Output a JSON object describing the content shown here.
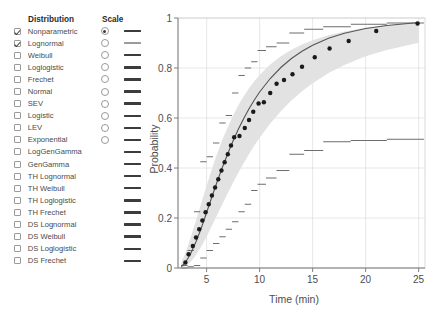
{
  "panel": {
    "header_distribution": "Distribution",
    "header_scale": "Scale",
    "rows": [
      {
        "label": "Nonparametric",
        "checked": true,
        "has_radio": true,
        "radio_selected": true,
        "line_color": "#3c3c3c"
      },
      {
        "label": "Lognormal",
        "checked": true,
        "has_radio": true,
        "radio_selected": false,
        "line_color": "#9b9b9b"
      },
      {
        "label": "Weibull",
        "checked": false,
        "has_radio": true,
        "radio_selected": false,
        "line_color": "#3c3c3c"
      },
      {
        "label": "Loglogistic",
        "checked": false,
        "has_radio": true,
        "radio_selected": false,
        "line_color": "#3c3c3c"
      },
      {
        "label": "Frechet",
        "checked": false,
        "has_radio": true,
        "radio_selected": false,
        "line_color": "#3c3c3c"
      },
      {
        "label": "Normal",
        "checked": false,
        "has_radio": true,
        "radio_selected": false,
        "line_color": "#3c3c3c"
      },
      {
        "label": "SEV",
        "checked": false,
        "has_radio": true,
        "radio_selected": false,
        "line_color": "#3c3c3c"
      },
      {
        "label": "Logistic",
        "checked": false,
        "has_radio": true,
        "radio_selected": false,
        "line_color": "#3c3c3c"
      },
      {
        "label": "LEV",
        "checked": false,
        "has_radio": true,
        "radio_selected": false,
        "line_color": "#3c3c3c"
      },
      {
        "label": "Exponential",
        "checked": false,
        "has_radio": true,
        "radio_selected": false,
        "line_color": "#3c3c3c"
      },
      {
        "label": "LogGenGamma",
        "checked": false,
        "has_radio": false,
        "radio_selected": false,
        "line_color": "#3c3c3c"
      },
      {
        "label": "GenGamma",
        "checked": false,
        "has_radio": false,
        "radio_selected": false,
        "line_color": "#3c3c3c"
      },
      {
        "label": "TH Lognormal",
        "checked": false,
        "has_radio": false,
        "radio_selected": false,
        "line_color": "#3c3c3c"
      },
      {
        "label": "TH Weibull",
        "checked": false,
        "has_radio": false,
        "radio_selected": false,
        "line_color": "#3c3c3c"
      },
      {
        "label": "TH Loglogistic",
        "checked": false,
        "has_radio": false,
        "radio_selected": false,
        "line_color": "#3c3c3c"
      },
      {
        "label": "TH Frechet",
        "checked": false,
        "has_radio": false,
        "radio_selected": false,
        "line_color": "#3c3c3c"
      },
      {
        "label": "DS Lognormal",
        "checked": false,
        "has_radio": false,
        "radio_selected": false,
        "line_color": "#3c3c3c"
      },
      {
        "label": "DS Weibull",
        "checked": false,
        "has_radio": false,
        "radio_selected": false,
        "line_color": "#3c3c3c"
      },
      {
        "label": "DS Loglogistic",
        "checked": false,
        "has_radio": false,
        "radio_selected": false,
        "line_color": "#3c3c3c"
      },
      {
        "label": "DS Frechet",
        "checked": false,
        "has_radio": false,
        "radio_selected": false,
        "line_color": "#3c3c3c"
      }
    ]
  },
  "chart_data": {
    "type": "line",
    "title": "",
    "xlabel": "Time (min)",
    "ylabel": "Probability",
    "xlim": [
      2.3,
      25.6
    ],
    "ylim": [
      0,
      1
    ],
    "xticks": [
      5,
      10,
      15,
      20,
      25
    ],
    "yticks": [
      0,
      0.2,
      0.4,
      0.6,
      0.8,
      1
    ],
    "ytick_labels": [
      "0",
      "0.2",
      "0.4",
      "0.6",
      "0.8",
      "1"
    ],
    "xtick_labels": [
      "5",
      "10",
      "15",
      "20",
      "25"
    ],
    "grid": true,
    "legend": "none",
    "band_color": "#e2e2e2",
    "fit_color": "#555555",
    "point_color": "#1a1a1a",
    "step_color": "#6d6d6d",
    "series": [
      {
        "name": "Lognormal fit",
        "type": "line",
        "x": [
          2.6,
          3.0,
          3.5,
          4.0,
          4.5,
          5.0,
          5.5,
          6.0,
          6.5,
          7.0,
          7.5,
          8.0,
          8.5,
          9.0,
          9.5,
          10.0,
          11.0,
          12.0,
          13.0,
          14.0,
          15.0,
          16.5,
          18.0,
          20.0,
          22.0,
          25.0
        ],
        "y": [
          0.005,
          0.022,
          0.058,
          0.105,
          0.16,
          0.222,
          0.285,
          0.346,
          0.404,
          0.458,
          0.509,
          0.556,
          0.598,
          0.637,
          0.672,
          0.704,
          0.758,
          0.802,
          0.838,
          0.867,
          0.891,
          0.919,
          0.939,
          0.958,
          0.97,
          0.982
        ]
      },
      {
        "name": "Lognormal 95% CI lower",
        "type": "line",
        "x": [
          2.6,
          3.0,
          3.5,
          4.0,
          4.5,
          5.0,
          5.5,
          6.0,
          6.5,
          7.0,
          7.5,
          8.0,
          8.5,
          9.0,
          9.5,
          10.0,
          11.0,
          12.0,
          13.0,
          14.0,
          15.0,
          16.5,
          18.0,
          20.0,
          22.0,
          25.0
        ],
        "y": [
          0.001,
          0.007,
          0.025,
          0.052,
          0.086,
          0.126,
          0.169,
          0.213,
          0.257,
          0.3,
          0.342,
          0.382,
          0.42,
          0.456,
          0.49,
          0.521,
          0.578,
          0.627,
          0.67,
          0.707,
          0.739,
          0.78,
          0.812,
          0.847,
          0.872,
          0.901
        ]
      },
      {
        "name": "Lognormal 95% CI upper",
        "type": "line",
        "x": [
          2.6,
          3.0,
          3.5,
          4.0,
          4.5,
          5.0,
          5.5,
          6.0,
          6.5,
          7.0,
          7.5,
          8.0,
          8.5,
          9.0,
          9.5,
          10.0,
          11.0,
          12.0,
          13.0,
          14.0,
          15.0,
          16.5,
          18.0,
          20.0,
          22.0,
          25.0
        ],
        "y": [
          0.02,
          0.06,
          0.122,
          0.19,
          0.26,
          0.33,
          0.396,
          0.458,
          0.514,
          0.564,
          0.61,
          0.651,
          0.687,
          0.719,
          0.747,
          0.772,
          0.814,
          0.847,
          0.873,
          0.894,
          0.911,
          0.931,
          0.946,
          0.961,
          0.971,
          0.982
        ]
      },
      {
        "name": "Nonparametric estimate",
        "type": "scatter",
        "x": [
          3.0,
          3.3,
          3.7,
          4.0,
          4.3,
          4.6,
          4.9,
          5.2,
          5.5,
          5.8,
          6.1,
          6.4,
          6.7,
          7.0,
          7.3,
          7.6,
          8.1,
          8.6,
          9.0,
          9.4,
          9.9,
          10.4,
          11.0,
          11.6,
          12.3,
          13.1,
          14.0,
          15.2,
          16.6,
          18.4,
          21.0,
          24.9
        ],
        "y": [
          0.022,
          0.055,
          0.088,
          0.122,
          0.155,
          0.19,
          0.223,
          0.255,
          0.29,
          0.322,
          0.355,
          0.39,
          0.423,
          0.455,
          0.49,
          0.523,
          0.528,
          0.56,
          0.592,
          0.625,
          0.658,
          0.663,
          0.7,
          0.737,
          0.752,
          0.775,
          0.805,
          0.843,
          0.878,
          0.908,
          0.948,
          0.978
        ]
      },
      {
        "name": "Nonparametric step bounds",
        "type": "step",
        "x": [
          2.6,
          3.2,
          3.8,
          4.4,
          5.0,
          5.6,
          6.2,
          6.8,
          7.4,
          8.0,
          8.6,
          9.2,
          9.8,
          10.6,
          11.6,
          12.8,
          14.2,
          16.0,
          18.6,
          22.0,
          25.5
        ],
        "y_upper": [
          0.01,
          0.07,
          0.225,
          0.425,
          0.445,
          0.5,
          0.58,
          0.61,
          0.7,
          0.77,
          0.8,
          0.825,
          0.87,
          0.885,
          0.9,
          0.94,
          0.955,
          0.965,
          0.975,
          0.98,
          0.985
        ],
        "y_lower": [
          0.0,
          0.005,
          0.01,
          0.04,
          0.07,
          0.098,
          0.125,
          0.155,
          0.185,
          0.225,
          0.255,
          0.31,
          0.335,
          0.36,
          0.39,
          0.455,
          0.47,
          0.505,
          0.51,
          0.515,
          0.52
        ]
      }
    ]
  }
}
